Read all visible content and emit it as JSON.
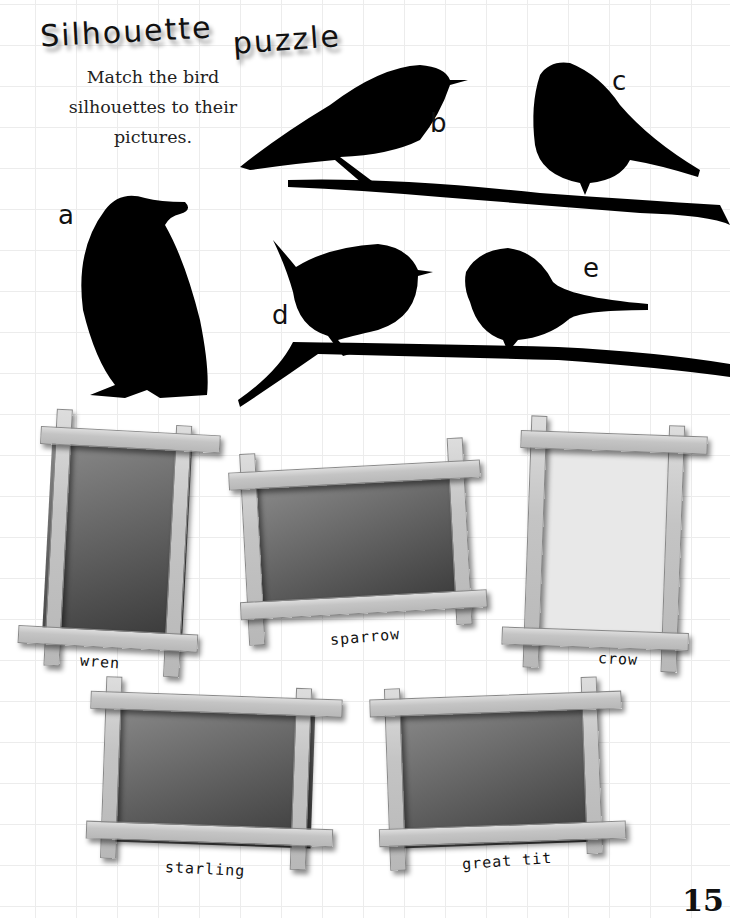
{
  "page": {
    "title_word1": "Silhouette",
    "title_word2": "puzzle",
    "instructions": "Match the bird silhouettes to their pictures.",
    "page_number": "15"
  },
  "silhouettes": [
    {
      "letter": "a",
      "shape": "crow-silhouette"
    },
    {
      "letter": "b",
      "shape": "starling-silhouette"
    },
    {
      "letter": "c",
      "shape": "sparrow-silhouette"
    },
    {
      "letter": "d",
      "shape": "wren-silhouette"
    },
    {
      "letter": "e",
      "shape": "great-tit-silhouette"
    }
  ],
  "pictures": [
    {
      "caption": "wren"
    },
    {
      "caption": "sparrow"
    },
    {
      "caption": "crow"
    },
    {
      "caption": "starling"
    },
    {
      "caption": "great tit"
    }
  ],
  "colors": {
    "silhouette": "#000000",
    "frame_wood": "#c8c8c8",
    "grid": "#ececec"
  }
}
